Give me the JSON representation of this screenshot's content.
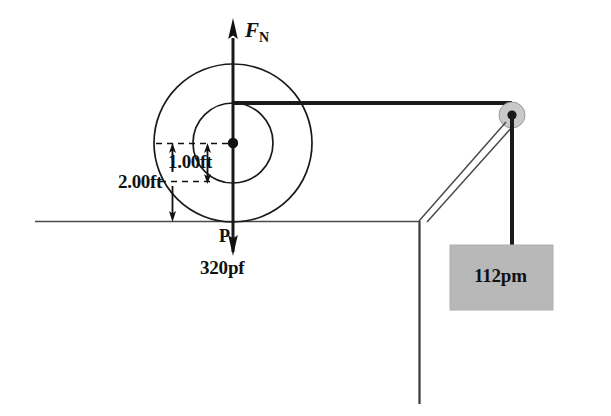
{
  "figure": {
    "labels": {
      "normal_force": "F",
      "normal_force_subscript": "N",
      "inner_radius_dim": "1.00ft",
      "outer_radius_dim": "2.00ft",
      "contact_point": "P",
      "applied_force": "320pf",
      "hanging_block": "112pm"
    },
    "colors": {
      "ink": "#111111",
      "line": "#4a4a4a",
      "block_fill": "#b8b8b8",
      "pulley_fill": "#c9c9c9",
      "pulley_hub": "#1a1a1a",
      "background": "#ffffff"
    },
    "geometry": {
      "spool_center_x": 233,
      "spool_center_y": 143,
      "spool_inner_radius": 40,
      "spool_outer_radius": 79,
      "ground_y": 222,
      "ground_left_x": 35,
      "ground_right_x": 419,
      "wall_x": 419,
      "wall_bottom_y": 404,
      "pulley_center_x": 512,
      "pulley_center_y": 115,
      "pulley_radius": 13,
      "cord_y": 103,
      "block_left_x": 450,
      "block_top_y": 245,
      "block_width": 103,
      "block_height": 65
    }
  }
}
